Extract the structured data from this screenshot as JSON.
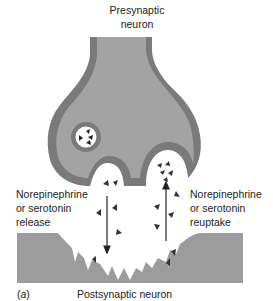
{
  "diagram": {
    "title_line1": "Presynaptic",
    "title_line2": "neuron",
    "left_label": [
      "Norepinephrine",
      "or serotonin",
      "release"
    ],
    "right_label": [
      "Norepinephrine",
      "or serotonin",
      "reuptake"
    ],
    "panel_label_prefix": "(",
    "panel_letter": "a",
    "panel_label_suffix": ")",
    "bottom_label": "Postsynaptic neuron"
  },
  "colors": {
    "membrane": "#7a7a7a",
    "cytoplasm": "#a3a3a3",
    "postsynaptic": "#9c9c9c",
    "molecule": "#333333",
    "background": "#ffffff"
  }
}
